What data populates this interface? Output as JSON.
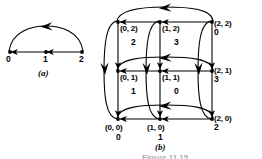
{
  "figure": {
    "caption_partial": "Figure 11.15",
    "panels": [
      {
        "id": "a",
        "label": "(a)"
      },
      {
        "id": "b",
        "label": "(b)"
      }
    ]
  },
  "panel_a": {
    "label": "(a)",
    "nodes": [
      {
        "id": "a0",
        "label": "0",
        "x": 10,
        "y": 58
      },
      {
        "id": "a1",
        "label": "1",
        "x": 46,
        "y": 58
      },
      {
        "id": "a2",
        "label": "2",
        "x": 82,
        "y": 58
      }
    ],
    "edges": [
      {
        "from": "2",
        "to": "1",
        "style": "straight",
        "direction": "leftward"
      },
      {
        "from": "1",
        "to": "0",
        "style": "straight",
        "direction": "leftward"
      },
      {
        "from": "2",
        "to": "0",
        "style": "arc-above",
        "direction": "leftward"
      }
    ]
  },
  "panel_b": {
    "label": "(b)",
    "nodes": [
      {
        "id": "n02",
        "coord": "(0, 2)",
        "value": "2",
        "col": 0,
        "row": 2
      },
      {
        "id": "n12",
        "coord": "(1, 2)",
        "value": "3",
        "col": 1,
        "row": 2
      },
      {
        "id": "n22",
        "coord": "(2, 2)",
        "value": "0",
        "col": 2,
        "row": 2
      },
      {
        "id": "n01",
        "coord": "(0, 1)",
        "value": "1",
        "col": 0,
        "row": 1
      },
      {
        "id": "n11",
        "coord": "(1, 1)",
        "value": "0",
        "col": 1,
        "row": 1
      },
      {
        "id": "n21",
        "coord": "(2, 1)",
        "value": "3",
        "col": 2,
        "row": 1
      },
      {
        "id": "n00",
        "coord": "(0, 0)",
        "value": "0",
        "col": 0,
        "row": 0
      },
      {
        "id": "n10",
        "coord": "(1, 0)",
        "value": "1",
        "col": 1,
        "row": 0
      },
      {
        "id": "n20",
        "coord": "(2, 0)",
        "value": "2",
        "col": 2,
        "row": 0
      }
    ],
    "edge_summary": {
      "horizontal_straight": "rightmost to middle and middle to leftmost in each of the three rows",
      "horizontal_arc": "rightmost to leftmost arc above each row",
      "vertical_straight": "top to middle and middle to bottom in each of the three columns",
      "vertical_arc": "top to bottom arc beside each column"
    }
  },
  "colors": {
    "ink": "#000000",
    "background": "#ffffff",
    "caption_faded": "#4a4a4a"
  }
}
